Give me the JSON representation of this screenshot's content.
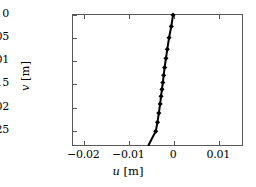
{
  "chart_data": {
    "type": "line",
    "title": "",
    "subtitle": "",
    "xlabel": "u [m]",
    "ylabel": "v [m]",
    "xlabel_symbol": "u",
    "xlabel_unit": "[m]",
    "ylabel_symbol": "v",
    "ylabel_unit": "[m]",
    "grid": false,
    "legend": null,
    "xlim": [
      -0.0225,
      0.0155
    ],
    "ylim": [
      -0.0285,
      0.0
    ],
    "xticks": [
      -0.02,
      -0.01,
      0,
      0.01
    ],
    "xticklabels": [
      "-0.02",
      "-0.01",
      "0",
      "0.01"
    ],
    "yticks": [
      0,
      -0.005,
      -0.01,
      -0.015,
      -0.02,
      -0.025
    ],
    "yticklabels": [
      "0",
      "-0.005",
      "-0.01",
      "-0.015",
      "-0.02",
      "-0.025"
    ],
    "line_color": "#000000",
    "marker_color": "#000000",
    "marker": "diamond",
    "linewidth": 2.0,
    "series": [
      {
        "name": "displacement profile",
        "x": [
          0.0,
          -0.0004,
          -0.0009,
          -0.0013,
          -0.0016,
          -0.0019,
          -0.0021,
          -0.0023,
          -0.0025,
          -0.0027,
          -0.0029,
          -0.0032,
          -0.0035,
          -0.0039,
          -0.0055
        ],
        "y": [
          0.0,
          -0.0025,
          -0.005,
          -0.0075,
          -0.0095,
          -0.0115,
          -0.0132,
          -0.0148,
          -0.0163,
          -0.0178,
          -0.0195,
          -0.0215,
          -0.0235,
          -0.0255,
          -0.0285
        ]
      }
    ],
    "markers": [
      {
        "x": 0.0,
        "y": 0.0
      },
      {
        "x": -0.0004,
        "y": -0.0025
      },
      {
        "x": -0.0009,
        "y": -0.005
      },
      {
        "x": -0.0013,
        "y": -0.0075
      },
      {
        "x": -0.0016,
        "y": -0.0095
      },
      {
        "x": -0.0019,
        "y": -0.0115
      },
      {
        "x": -0.0021,
        "y": -0.0132
      },
      {
        "x": -0.0023,
        "y": -0.0148
      },
      {
        "x": -0.0025,
        "y": -0.0163
      },
      {
        "x": -0.0027,
        "y": -0.0178
      },
      {
        "x": -0.0029,
        "y": -0.0195
      },
      {
        "x": -0.0032,
        "y": -0.0215
      },
      {
        "x": -0.0035,
        "y": -0.0235
      },
      {
        "x": -0.0039,
        "y": -0.0255
      }
    ]
  },
  "axes": {
    "frame_color": "#58585a",
    "background": "#ffffff"
  }
}
